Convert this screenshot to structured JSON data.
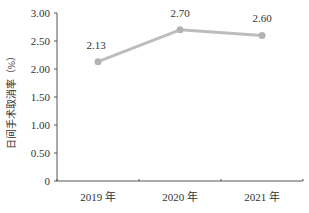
{
  "chart_data": {
    "type": "line",
    "title": "",
    "xlabel": "",
    "ylabel": "日间手术取消率（%）",
    "categories": [
      "2019 年",
      "2020 年",
      "2021 年"
    ],
    "series": [
      {
        "name": "日间手术取消率",
        "values": [
          2.13,
          2.7,
          2.6
        ],
        "color": "#bdbdbd"
      }
    ],
    "data_labels": [
      "2.13",
      "2.70",
      "2.60"
    ],
    "yticks": [
      "0",
      "0.50",
      "1.00",
      "1.50",
      "2.00",
      "2.50",
      "3.00"
    ],
    "ytick_values": [
      0,
      0.5,
      1.0,
      1.5,
      2.0,
      2.5,
      3.0
    ],
    "ylim": [
      0,
      3.0
    ],
    "grid": false,
    "legend": null
  },
  "colors": {
    "line": "#bdbdbd",
    "marker": "#b3b3b3",
    "axis": "#555555",
    "text": "#333333"
  }
}
